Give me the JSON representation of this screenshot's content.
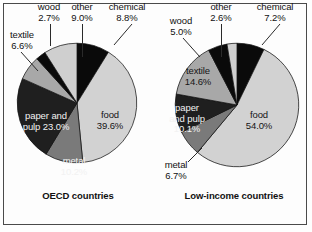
{
  "figure": {
    "background": "#fdfdfd",
    "border_color": "#4a4a4a",
    "width": 312,
    "height": 232
  },
  "palette": {
    "chemical": "#0a0a0a",
    "food": "#d2d2d2",
    "metal": "#7a7a7a",
    "paper_and_pulp": "#1f1f1f",
    "textile": "#a8a8a8",
    "wood": "#0a0a0a",
    "other": "#cfcfcf",
    "outline": "#111111",
    "text_dark": "#111111",
    "text_light": "#f2f2f2"
  },
  "chart_data": [
    {
      "type": "pie",
      "title": "OECD countries",
      "chart_id": "oecd",
      "categories": [
        "chemical",
        "food",
        "metal",
        "paper and pulp",
        "textile",
        "wood",
        "other"
      ],
      "values": [
        8.8,
        39.6,
        10.2,
        23.0,
        6.6,
        2.7,
        9.0
      ],
      "labels": [
        {
          "name": "chemical",
          "text": "chemical",
          "value": "8.8%",
          "placement": "outside",
          "leader": true
        },
        {
          "name": "food",
          "text": "food",
          "value": "39.6%",
          "placement": "inside",
          "leader": false
        },
        {
          "name": "metal",
          "text": "metal",
          "value": "10.2%",
          "placement": "inside",
          "leader": false
        },
        {
          "name": "paper and pulp",
          "text": "paper and",
          "value": "pulp 23.0%",
          "placement": "inside",
          "leader": false
        },
        {
          "name": "textile",
          "text": "textile",
          "value": "6.6%",
          "placement": "outside",
          "leader": true
        },
        {
          "name": "wood",
          "text": "wood",
          "value": "2.7%",
          "placement": "outside",
          "leader": true
        },
        {
          "name": "other",
          "text": "other",
          "value": "9.0%",
          "placement": "outside",
          "leader": true
        }
      ],
      "start_angle": 0,
      "direction": "clockwise",
      "legend": "none",
      "grid": false,
      "units": "percent"
    },
    {
      "type": "pie",
      "title": "Low-income countries",
      "chart_id": "low-income",
      "categories": [
        "chemical",
        "food",
        "metal",
        "paper and pulp",
        "textile",
        "wood",
        "other"
      ],
      "values": [
        7.2,
        54.0,
        6.7,
        10.1,
        14.6,
        5.0,
        2.6
      ],
      "labels": [
        {
          "name": "chemical",
          "text": "chemical",
          "value": "7.2%",
          "placement": "outside",
          "leader": true
        },
        {
          "name": "food",
          "text": "food",
          "value": "54.0%",
          "placement": "inside",
          "leader": false
        },
        {
          "name": "metal",
          "text": "metal",
          "value": "6.7%",
          "placement": "outside",
          "leader": true
        },
        {
          "name": "paper and pulp",
          "text": "paper",
          "value": "and pulp",
          "value2": "10.1%",
          "placement": "inside",
          "leader": false
        },
        {
          "name": "textile",
          "text": "textile",
          "value": "14.6%",
          "placement": "inside",
          "leader": false
        },
        {
          "name": "wood",
          "text": "wood",
          "value": "5.0%",
          "placement": "outside",
          "leader": true
        },
        {
          "name": "other",
          "text": "other",
          "value": "2.6%",
          "placement": "outside",
          "leader": true
        }
      ],
      "start_angle": 0,
      "direction": "clockwise",
      "legend": "none",
      "grid": false,
      "units": "percent"
    }
  ],
  "oecd": {
    "title": "OECD countries",
    "wood_name": "wood",
    "wood_pct": "2.7%",
    "other_name": "other",
    "other_pct": "9.0%",
    "chemical_name": "chemical",
    "chemical_pct": "8.8%",
    "textile_name": "textile",
    "textile_pct": "6.6%",
    "food_name": "food",
    "food_pct": "39.6%",
    "metal_name": "metal",
    "metal_pct": "10.2%",
    "paper_line1": "paper and",
    "paper_line2": "pulp 23.0%"
  },
  "low": {
    "title": "Low-income countries",
    "wood_name": "wood",
    "wood_pct": "5.0%",
    "other_name": "other",
    "other_pct": "2.6%",
    "chemical_name": "chemical",
    "chemical_pct": "7.2%",
    "textile_name": "textile",
    "textile_pct": "14.6%",
    "food_name": "food",
    "food_pct": "54.0%",
    "metal_name": "metal",
    "metal_pct": "6.7%",
    "paper_line1": "paper",
    "paper_line2": "and pulp",
    "paper_line3": "10.1%"
  }
}
